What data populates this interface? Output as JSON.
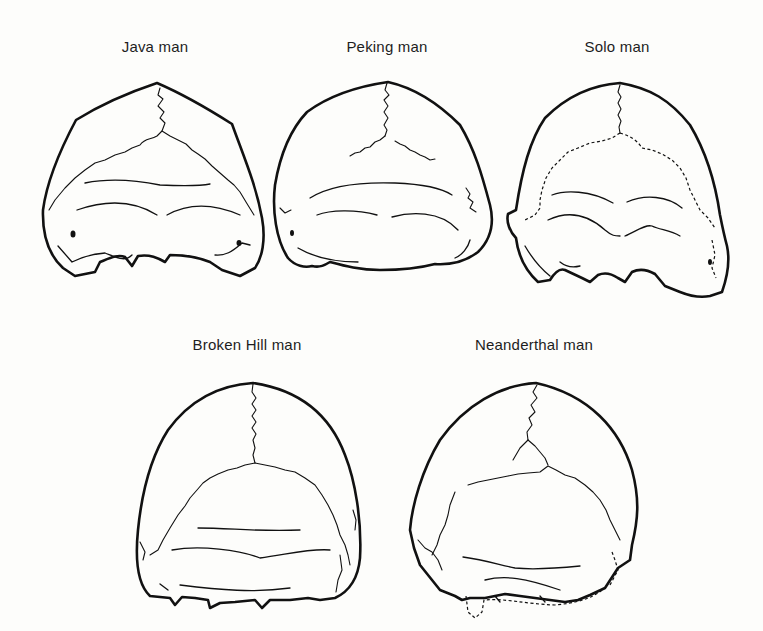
{
  "figure": {
    "type": "illustration",
    "panels": [
      {
        "label": "Java man"
      },
      {
        "label": "Peking man"
      },
      {
        "label": "Solo man"
      },
      {
        "label": "Broken Hill man"
      },
      {
        "label": "Neanderthal man"
      }
    ]
  }
}
